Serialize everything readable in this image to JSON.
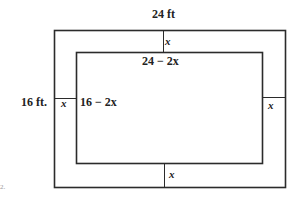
{
  "figure": {
    "outer_width_label": "24 ft",
    "outer_height_label": "16 ft.",
    "border_top_label": "x",
    "border_left_label": "x",
    "border_right_label": "x",
    "border_bottom_label": "x",
    "inner_width_label": "24 − 2x",
    "inner_height_label": "16 − 2x",
    "stray_mark": "2.",
    "line_color": "#2b2b2b"
  }
}
